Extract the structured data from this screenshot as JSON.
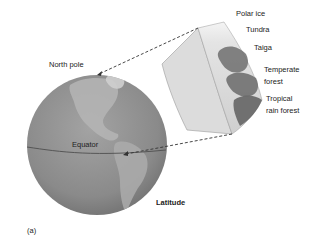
{
  "figure": {
    "panel_label": "(a)",
    "title": "Latitude",
    "globe_labels": {
      "north_pole": "North pole",
      "equator": "Equator"
    },
    "biomes": [
      {
        "label_line1": "Polar ice",
        "label_line2": ""
      },
      {
        "label_line1": "Tundra",
        "label_line2": ""
      },
      {
        "label_line1": "Taiga",
        "label_line2": ""
      },
      {
        "label_line1": "Temperate",
        "label_line2": "forest"
      },
      {
        "label_line1": "Tropical",
        "label_line2": "rain forest"
      }
    ],
    "colors": {
      "globe": "#8c8c8c",
      "land": "#b4b4b4",
      "slice_face": "#dcdcdc",
      "vegetation": "#6a6a6a",
      "equator_line": "#555555",
      "dashed": "#333333"
    }
  }
}
